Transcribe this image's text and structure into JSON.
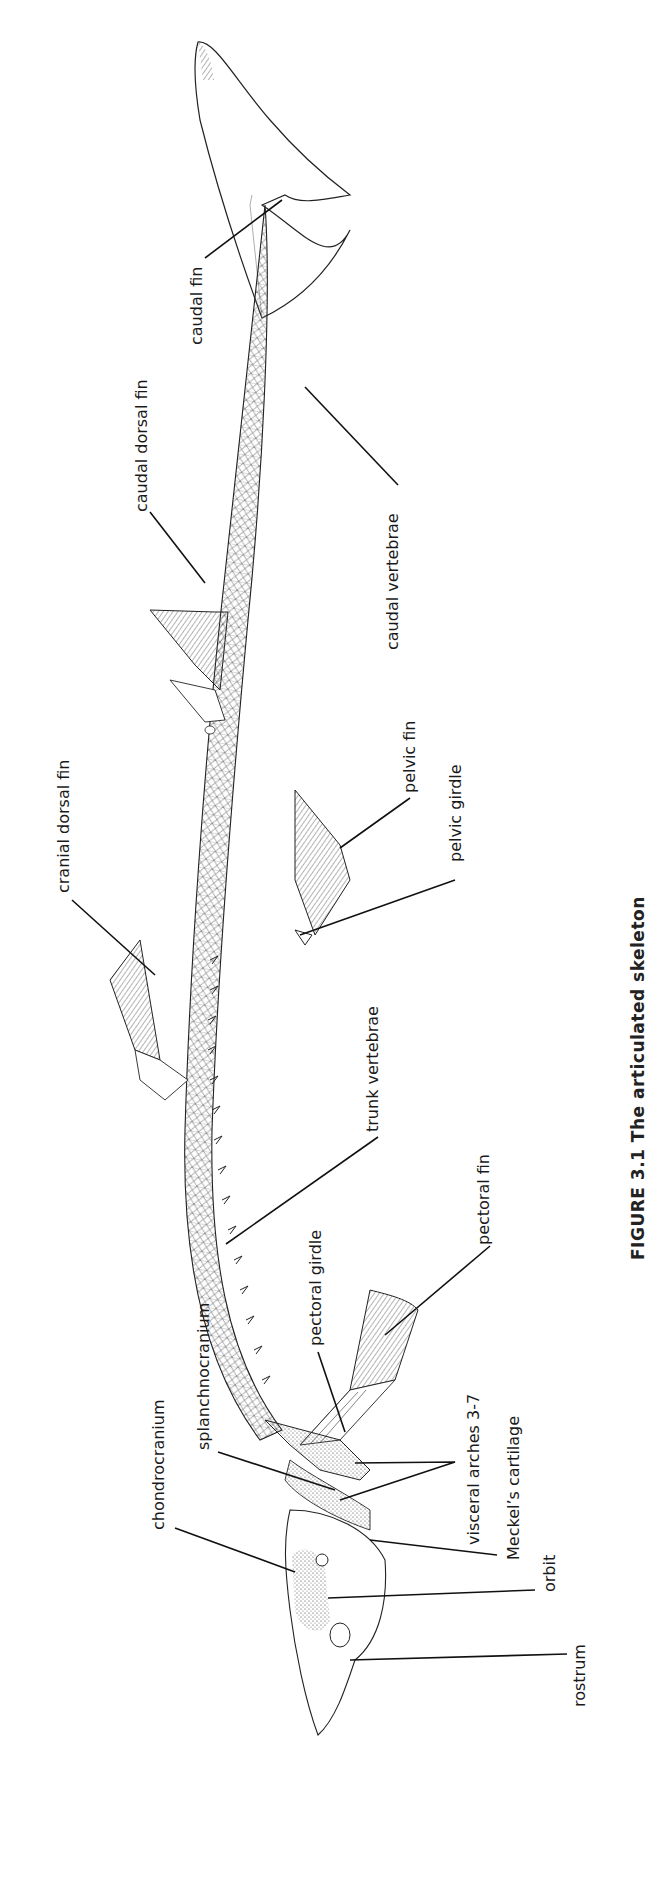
{
  "figure": {
    "caption_visible_fragment": "FIGURE 3.1  The articulated skeleton"
  },
  "labels": [
    {
      "id": "caudal-fin",
      "text": "caudal fin"
    },
    {
      "id": "caudal-dorsal-fin",
      "text": "caudal dorsal fin"
    },
    {
      "id": "caudal-vertebrae",
      "text": "caudal vertebrae"
    },
    {
      "id": "pelvic-fin",
      "text": "pelvic fin"
    },
    {
      "id": "pelvic-girdle",
      "text": "pelvic girdle"
    },
    {
      "id": "cranial-dorsal-fin",
      "text": "cranial dorsal fin"
    },
    {
      "id": "trunk-vertebrae",
      "text": "trunk vertebrae"
    },
    {
      "id": "pectoral-girdle",
      "text": "pectoral girdle"
    },
    {
      "id": "pectoral-fin",
      "text": "pectoral fin"
    },
    {
      "id": "splanchnocranium",
      "text": "splanchnocranium"
    },
    {
      "id": "chondrocranium",
      "text": "chondrocranium"
    },
    {
      "id": "visceral-arches",
      "text": "visceral arches 3-7"
    },
    {
      "id": "meckels-cartilage",
      "text": "Meckel’s cartilage"
    },
    {
      "id": "orbit",
      "text": "orbit"
    },
    {
      "id": "rostrum",
      "text": "rostrum"
    }
  ],
  "colors": {
    "ink": "#1a1a1a",
    "paper": "#ffffff",
    "hatch": "#444444"
  }
}
